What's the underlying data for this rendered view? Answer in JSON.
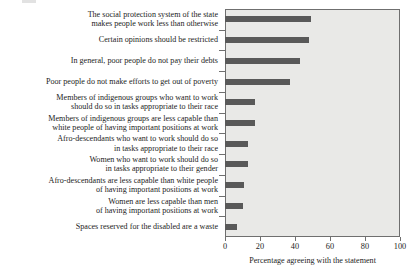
{
  "chart_data": {
    "type": "bar",
    "orientation": "horizontal",
    "title": "",
    "xlabel": "Percentage agreeing with the statement",
    "ylabel": "",
    "xlim": [
      0,
      100
    ],
    "xticks": [
      0,
      20,
      40,
      60,
      80,
      100
    ],
    "xticklabels": [
      "0",
      "20",
      "40",
      "60",
      "80",
      "100"
    ],
    "grid": false,
    "legend": null,
    "bar_color": "#595959",
    "plot_background": "#e9e9e7",
    "categories": [
      "The social protection system of the state\nmakes people work less than otherwise",
      "Certain opinions should be restricted",
      "In general, poor people do not pay their debts",
      "Poor people do not make efforts to get out of poverty",
      "Members of indigenous groups who want to work\nshould do so in tasks appropriate to their race",
      "Members of indigenous groups are less capable than\nwhite people of having important positions at work",
      "Afro-descendants who want to work should do so\nin tasks appropriate to their race",
      "Women who want to work should do so\nin tasks appropriate to their gender",
      "Afro-descendants are less capable than white people\nof having important positions at work",
      "Women are less capable than men\nof having important positions at work",
      "Spaces reserved for the disabled are a waste"
    ],
    "values": [
      49,
      48,
      43,
      37,
      17,
      17,
      13,
      13,
      11,
      10,
      7
    ]
  }
}
